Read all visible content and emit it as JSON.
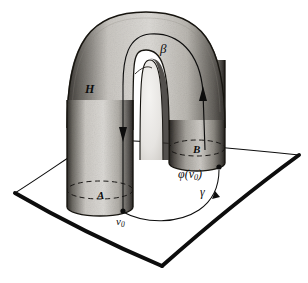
{
  "figure": {
    "background_color": "#ffffff",
    "ink_color": "#0d0d0d",
    "tube_fill_light": "#d8d6d2",
    "tube_fill_mid": "#b4b1ab",
    "tube_fill_dark": "#6e6b66",
    "tube_shadow": "#2a2825"
  },
  "labels": {
    "handle": "H",
    "base_left": "A",
    "base_right": "B",
    "arc_curve": "β",
    "plane_curve": "γ",
    "basepoint": "v",
    "basepoint_sub": "0",
    "image_point_prefix": "φ(v",
    "image_point_sub": "0",
    "image_point_suffix": ")"
  },
  "geometry": {
    "plane_corners": [
      {
        "name": "left",
        "x": 15,
        "y": 193
      },
      {
        "name": "top",
        "x": 97,
        "y": 139
      },
      {
        "name": "right",
        "x": 299,
        "y": 155
      },
      {
        "name": "bottom",
        "x": 162,
        "y": 266
      }
    ],
    "left_cylinder": {
      "center_x": 100,
      "base_y": 207,
      "radius_x": 33,
      "radius_y": 9
    },
    "right_cylinder": {
      "center_x": 197,
      "base_y": 163,
      "radius_x": 28,
      "radius_y": 8
    },
    "basepoint": {
      "x": 123,
      "y": 212
    },
    "image_point": {
      "x": 219,
      "y": 168
    },
    "arrow_down": {
      "x": 123,
      "y": 136
    },
    "arrow_up": {
      "x": 207,
      "y": 95
    },
    "arrow_gamma": {
      "x": 213,
      "y": 196
    }
  }
}
